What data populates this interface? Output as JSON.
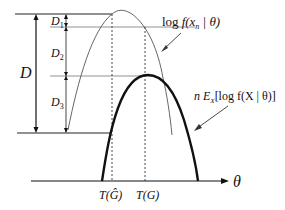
{
  "diagram": {
    "type": "statistical-bias-illustration",
    "labels": {
      "D": "D",
      "D1": "D",
      "D1_sub": "1",
      "D2": "D",
      "D2_sub": "2",
      "D3": "D",
      "D3_sub": "3",
      "theta_axis": "θ",
      "T_hatG": "T(Ĝ)",
      "T_G": "T(G)",
      "thin_curve_prefix": "log",
      "thin_curve_expr": "f(x",
      "thin_curve_sub": "n",
      "thin_curve_suffix": " | θ)",
      "thick_curve_prefix": "n E",
      "thick_curve_sub": "X",
      "thick_curve_expr": "[log f(X | θ)]"
    },
    "curves": [
      {
        "name": "log-likelihood-sample",
        "style": "thin",
        "peak_x": 120,
        "peak_y": 10
      },
      {
        "name": "expected-log-likelihood",
        "style": "thick",
        "peak_x": 148,
        "peak_y": 75
      }
    ],
    "colors": {
      "line": "#111111",
      "thin_curve": "#555555",
      "background": "#ffffff"
    }
  }
}
